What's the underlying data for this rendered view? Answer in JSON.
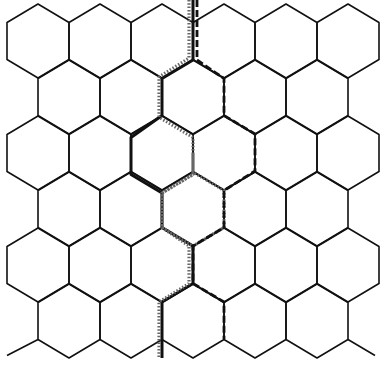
{
  "diagram": {
    "type": "hexagonal-grid",
    "grid": {
      "orientation": "pointy-top",
      "rows": 6,
      "even_row_count": 6,
      "odd_row_count": 5,
      "hex_width": 62,
      "hex_half_height": 37,
      "row_pitch": 56,
      "origin_x": 38,
      "origin_y": 41
    },
    "colors": {
      "background": "#ffffff",
      "grid_line": "#111111",
      "solid_path": "#111111",
      "dotted_path": "#666666",
      "dashed_path": "#111111"
    },
    "paths": [
      {
        "name": "solid-path",
        "style": "solid",
        "points": [
          [
            193,
            0
          ],
          [
            193,
            60
          ],
          [
            162,
            78.5
          ],
          [
            162,
            115.5
          ],
          [
            131,
            137.5
          ],
          [
            131,
            174.5
          ],
          [
            162,
            193
          ],
          [
            162,
            227.5
          ],
          [
            193,
            246
          ],
          [
            193,
            283.5
          ],
          [
            162,
            302
          ],
          [
            162,
            358
          ]
        ]
      },
      {
        "name": "dotted-path",
        "style": "dotted",
        "points": [
          [
            189,
            0
          ],
          [
            189,
            58
          ],
          [
            159,
            77
          ],
          [
            159,
            117
          ],
          [
            162,
            119
          ],
          [
            193,
            137.5
          ],
          [
            193,
            174.5
          ],
          [
            162,
            193
          ],
          [
            162,
            227.5
          ],
          [
            193,
            246
          ],
          [
            224,
            227.5
          ],
          [
            224,
            190.5
          ],
          [
            193,
            172
          ],
          [
            193,
            153
          ],
          [
            193,
            174.5
          ],
          [
            162,
            193
          ],
          [
            162,
            227.5
          ],
          [
            189,
            246
          ],
          [
            189,
            283.5
          ],
          [
            159,
            302
          ],
          [
            159,
            358
          ]
        ]
      },
      {
        "name": "dashed-path",
        "style": "dashed",
        "points": [
          [
            197,
            0
          ],
          [
            197,
            22.5
          ],
          [
            197,
            60
          ],
          [
            224,
            78.5
          ],
          [
            224,
            115.5
          ],
          [
            255,
            134
          ],
          [
            255,
            171
          ],
          [
            224,
            190.5
          ],
          [
            224,
            227.5
          ],
          [
            193,
            246
          ],
          [
            193,
            283.5
          ],
          [
            224,
            302
          ],
          [
            224,
            339
          ]
        ]
      }
    ]
  }
}
